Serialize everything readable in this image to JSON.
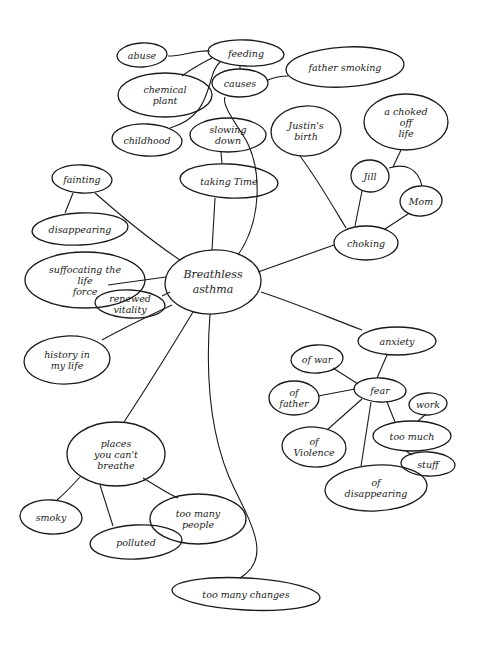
{
  "diagram": {
    "type": "hand-drawn mind map (cluster diagram)",
    "center": {
      "id": "breathless",
      "lines": [
        "Breathless",
        "asthma"
      ]
    },
    "nodes": [
      {
        "id": "breathless",
        "lines": [
          "Breathless",
          "asthma"
        ],
        "cx": 213,
        "cy": 282,
        "rx": 48,
        "ry": 32
      },
      {
        "id": "causes",
        "lines": [
          "causes"
        ],
        "cx": 240,
        "cy": 83,
        "rx": 28,
        "ry": 14
      },
      {
        "id": "feeding",
        "lines": [
          "feeding"
        ],
        "cx": 246,
        "cy": 53,
        "rx": 38,
        "ry": 13
      },
      {
        "id": "abuse",
        "lines": [
          "abuse"
        ],
        "cx": 142,
        "cy": 55,
        "rx": 25,
        "ry": 12
      },
      {
        "id": "chemical_plant",
        "lines": [
          "chemical",
          "plant"
        ],
        "cx": 165,
        "cy": 95,
        "rx": 47,
        "ry": 22
      },
      {
        "id": "childhood",
        "lines": [
          "childhood"
        ],
        "cx": 147,
        "cy": 140,
        "rx": 35,
        "ry": 16
      },
      {
        "id": "father_smoking",
        "lines": [
          "father smoking"
        ],
        "cx": 345,
        "cy": 67,
        "rx": 59,
        "ry": 20
      },
      {
        "id": "slowing_down",
        "lines": [
          "slowing",
          "down"
        ],
        "cx": 228,
        "cy": 135,
        "rx": 38,
        "ry": 17
      },
      {
        "id": "taking_time",
        "lines": [
          "taking Time"
        ],
        "cx": 229,
        "cy": 181,
        "rx": 49,
        "ry": 17
      },
      {
        "id": "justins_birth",
        "lines": [
          "Justin's",
          "birth"
        ],
        "cx": 306,
        "cy": 131,
        "rx": 35,
        "ry": 25
      },
      {
        "id": "choked_off_life",
        "lines": [
          "a choked",
          "off",
          "life"
        ],
        "cx": 406,
        "cy": 122,
        "rx": 42,
        "ry": 28
      },
      {
        "id": "jill",
        "lines": [
          "Jill"
        ],
        "cx": 370,
        "cy": 176,
        "rx": 19,
        "ry": 16
      },
      {
        "id": "mom",
        "lines": [
          "Mom"
        ],
        "cx": 421,
        "cy": 201,
        "rx": 21,
        "ry": 15
      },
      {
        "id": "choking",
        "lines": [
          "choking"
        ],
        "cx": 366,
        "cy": 243,
        "rx": 32,
        "ry": 17
      },
      {
        "id": "fainting",
        "lines": [
          "fainting"
        ],
        "cx": 82,
        "cy": 179,
        "rx": 30,
        "ry": 14
      },
      {
        "id": "disappearing_left",
        "lines": [
          "disappearing"
        ],
        "cx": 80,
        "cy": 229,
        "rx": 48,
        "ry": 16
      },
      {
        "id": "suffocating",
        "lines": [
          "suffocating the",
          "life",
          "force"
        ],
        "cx": 85,
        "cy": 280,
        "rx": 60,
        "ry": 28
      },
      {
        "id": "renewed_vitality",
        "lines": [
          "renewed",
          "vitality"
        ],
        "cx": 130,
        "cy": 304,
        "rx": 35,
        "ry": 14
      },
      {
        "id": "history",
        "lines": [
          "history in",
          "my life"
        ],
        "cx": 67,
        "cy": 360,
        "rx": 43,
        "ry": 24
      },
      {
        "id": "anxiety",
        "lines": [
          "anxiety"
        ],
        "cx": 397,
        "cy": 341,
        "rx": 39,
        "ry": 14
      },
      {
        "id": "fear",
        "lines": [
          "fear"
        ],
        "cx": 380,
        "cy": 390,
        "rx": 26,
        "ry": 12
      },
      {
        "id": "of_war",
        "lines": [
          "of war"
        ],
        "cx": 317,
        "cy": 359,
        "rx": 26,
        "ry": 14
      },
      {
        "id": "of_father",
        "lines": [
          "of",
          "father"
        ],
        "cx": 294,
        "cy": 398,
        "rx": 25,
        "ry": 17
      },
      {
        "id": "of_violence",
        "lines": [
          "of",
          "Violence"
        ],
        "cx": 314,
        "cy": 447,
        "rx": 32,
        "ry": 20
      },
      {
        "id": "work",
        "lines": [
          "work"
        ],
        "cx": 428,
        "cy": 404,
        "rx": 19,
        "ry": 11
      },
      {
        "id": "too_much",
        "lines": [
          "too much"
        ],
        "cx": 412,
        "cy": 436,
        "rx": 39,
        "ry": 15
      },
      {
        "id": "stuff",
        "lines": [
          "stuff"
        ],
        "cx": 428,
        "cy": 464,
        "rx": 27,
        "ry": 12
      },
      {
        "id": "of_disappearing",
        "lines": [
          "of",
          "disappearing"
        ],
        "cx": 376,
        "cy": 488,
        "rx": 51,
        "ry": 23
      },
      {
        "id": "places",
        "lines": [
          "places",
          "you can't",
          "breathe"
        ],
        "cx": 116,
        "cy": 454,
        "rx": 49,
        "ry": 32
      },
      {
        "id": "smoky",
        "lines": [
          "smoky"
        ],
        "cx": 51,
        "cy": 517,
        "rx": 31,
        "ry": 17
      },
      {
        "id": "polluted",
        "lines": [
          "polluted"
        ],
        "cx": 136,
        "cy": 542,
        "rx": 46,
        "ry": 17
      },
      {
        "id": "too_many_people",
        "lines": [
          "too many",
          "people"
        ],
        "cx": 198,
        "cy": 519,
        "rx": 48,
        "ry": 25
      },
      {
        "id": "too_many_changes",
        "lines": [
          "too many changes"
        ],
        "cx": 246,
        "cy": 594,
        "rx": 74,
        "ry": 16
      }
    ],
    "edges": [
      {
        "from": "breathless",
        "to": "causes",
        "path": "M238,255 C262,220 262,170 246,140 C232,118 222,104 225,97"
      },
      {
        "from": "causes",
        "to": "feeding",
        "path": "M240,69 L240,65"
      },
      {
        "from": "feeding",
        "to": "abuse",
        "path": "M210,51 C195,50 183,56 168,56"
      },
      {
        "from": "feeding",
        "to": "chemical_plant",
        "path": "M212,58 C200,64 190,70 182,76"
      },
      {
        "from": "feeding",
        "to": "childhood",
        "path": "M220,62 C205,75 215,115 170,128"
      },
      {
        "from": "causes",
        "to": "father_smoking",
        "path": "M268,80 C275,77 280,76 288,76"
      },
      {
        "from": "taking_time",
        "to": "slowing_down",
        "path": "M222,164 L221,152"
      },
      {
        "from": "breathless",
        "to": "taking_time",
        "path": "M212,250 L215,198"
      },
      {
        "from": "choking",
        "to": "justins_birth",
        "path": "M346,228 C335,210 318,180 300,156"
      },
      {
        "from": "choking",
        "to": "jill",
        "path": "M355,226 L362,191"
      },
      {
        "from": "choking",
        "to": "mom",
        "path": "M385,229 L408,214"
      },
      {
        "from": "jill",
        "to": "mom",
        "path": "M389,168 C405,163 418,168 422,186"
      },
      {
        "from": "jill",
        "to": "choked_off_life",
        "path": "M393,167 L401,150"
      },
      {
        "from": "breathless",
        "to": "choking",
        "path": "M258,272 L334,245"
      },
      {
        "from": "breathless",
        "to": "fainting",
        "path": "M180,260 C150,240 120,215 95,193"
      },
      {
        "from": "fainting",
        "to": "disappearing_left",
        "path": "M73,193 L65,213"
      },
      {
        "from": "breathless",
        "to": "suffocating",
        "path": "M166,277 L108,285"
      },
      {
        "from": "breathless",
        "to": "renewed_vitality",
        "path": "M170,292 L162,296"
      },
      {
        "from": "breathless",
        "to": "history",
        "path": "M172,305 C140,320 120,330 102,340"
      },
      {
        "from": "breathless",
        "to": "anxiety",
        "path": "M261,292 C300,305 330,318 362,330"
      },
      {
        "from": "anxiety",
        "to": "fear",
        "path": "M387,355 L377,378"
      },
      {
        "from": "fear",
        "to": "of_war",
        "path": "M358,384 L333,368"
      },
      {
        "from": "fear",
        "to": "of_father",
        "path": "M355,389 L318,396"
      },
      {
        "from": "fear",
        "to": "of_violence",
        "path": "M362,399 L327,430"
      },
      {
        "from": "fear",
        "to": "of_disappearing",
        "path": "M371,402 L361,466"
      },
      {
        "from": "fear",
        "to": "too_much",
        "path": "M387,402 L395,422"
      },
      {
        "from": "too_much",
        "to": "work",
        "path": "M418,421 L426,414"
      },
      {
        "from": "too_much",
        "to": "stuff",
        "path": "M406,451 L412,455"
      },
      {
        "from": "breathless",
        "to": "places",
        "path": "M193,312 C170,350 145,390 124,422"
      },
      {
        "from": "places",
        "to": "smoky",
        "path": "M80,477 C70,488 63,495 57,500"
      },
      {
        "from": "places",
        "to": "polluted",
        "path": "M100,485 L113,526"
      },
      {
        "from": "places",
        "to": "too_many_people",
        "path": "M143,478 C160,488 168,494 178,498"
      },
      {
        "from": "breathless",
        "to": "too_many_changes",
        "path": "M210,314 C205,380 210,440 235,490 C255,530 270,560 240,578"
      }
    ]
  }
}
